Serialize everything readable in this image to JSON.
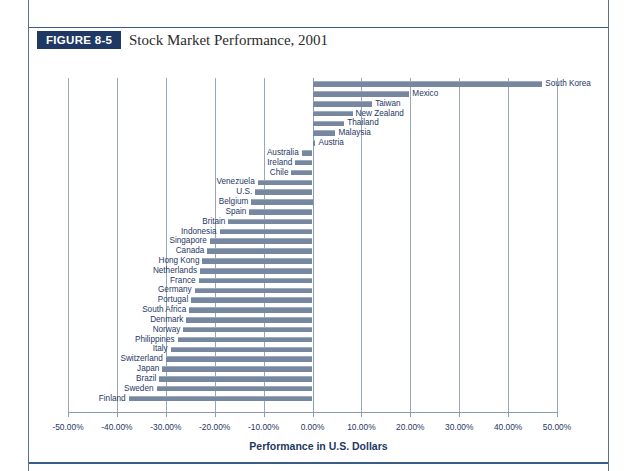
{
  "figure": {
    "number_label": "FIGURE 8-5",
    "title": "Stock Market Performance, 2001"
  },
  "colors": {
    "bar": "#76879f",
    "axis_text": "#1f3864",
    "gridline": "#9aa7ba",
    "badge_bg": "#1f3864",
    "rule": "#3c5b87"
  },
  "chart_data": {
    "type": "bar",
    "orientation": "horizontal",
    "title": "Stock Market Performance, 2001",
    "xlabel": "Performance in U.S. Dollars",
    "ylabel": "",
    "xlim": [
      -50,
      50
    ],
    "grid": true,
    "legend": "none",
    "units": "percent",
    "xtick_labels": [
      "-50.00%",
      "-40.00%",
      "-30.00%",
      "-20.00%",
      "-10.00%",
      "0.00%",
      "10.00%",
      "20.00%",
      "30.00%",
      "40.00%",
      "50.00%"
    ],
    "xticks": [
      -50,
      -40,
      -30,
      -20,
      -10,
      0,
      10,
      20,
      30,
      40,
      50
    ],
    "categories": [
      "South Korea",
      "Mexico",
      "Taiwan",
      "New Zealand",
      "Thailand",
      "Malaysia",
      "Austria",
      "Australia",
      "Ireland",
      "Chile",
      "Venezuela",
      "U.S.",
      "Belgium",
      "Spain",
      "Britain",
      "Indonesia",
      "Singapore",
      "Canada",
      "Hong Kong",
      "Netherlands",
      "France",
      "Germany",
      "Portugal",
      "South Africa",
      "Denmark",
      "Norway",
      "Philippines",
      "Italy",
      "Switzerland",
      "Japan",
      "Brazil",
      "Sweden",
      "Finland"
    ],
    "values": [
      47.0,
      19.8,
      12.2,
      8.2,
      6.5,
      4.7,
      0.6,
      -2.2,
      -3.5,
      -4.3,
      -11.2,
      -11.7,
      -12.5,
      -12.9,
      -17.2,
      -19.0,
      -21.0,
      -21.5,
      -22.5,
      -23.0,
      -23.3,
      -24.1,
      -24.8,
      -25.2,
      -25.8,
      -26.4,
      -27.6,
      -29.0,
      -30.0,
      -30.7,
      -31.3,
      -31.9,
      -37.6
    ]
  }
}
